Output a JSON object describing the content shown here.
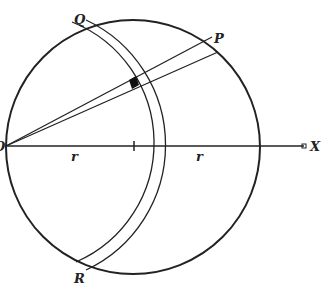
{
  "figure": {
    "colors": {
      "stroke": "#222222",
      "background": "#ffffff"
    },
    "labels": {
      "O": "O",
      "P": "P",
      "Q": "Q",
      "R": "R",
      "X": "X",
      "r_left": "r",
      "r_right": "r"
    },
    "elements": {
      "main_circle": {
        "cx": 133,
        "cy": 147,
        "r": 127
      },
      "axis": {
        "from": "O",
        "to": "X"
      },
      "shell_inner_radius": 122,
      "shell_outer_radius": 130,
      "rays": [
        "O-P upper",
        "O-P lower"
      ],
      "element": "small shaded volume element at intersection of cone and shell"
    }
  }
}
